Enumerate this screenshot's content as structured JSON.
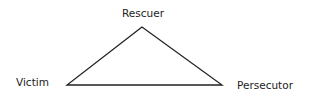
{
  "diagram": {
    "nodes": [
      {
        "id": "rescuer",
        "label": "Rescuer",
        "position": "top"
      },
      {
        "id": "victim",
        "label": "Victim",
        "position": "bottom-left"
      },
      {
        "id": "persecutor",
        "label": "Persecutor",
        "position": "bottom-right"
      }
    ],
    "edges": [
      {
        "from": "victim",
        "to": "rescuer"
      },
      {
        "from": "rescuer",
        "to": "persecutor"
      },
      {
        "from": "victim",
        "to": "persecutor"
      }
    ],
    "colors": {
      "line": "#222222",
      "text": "#222222",
      "background": "#ffffff"
    }
  }
}
